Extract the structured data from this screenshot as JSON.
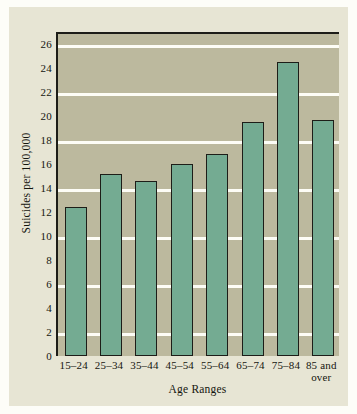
{
  "chart_data": {
    "type": "bar",
    "title": "",
    "xlabel": "Age Ranges",
    "ylabel": "Suicides per 100,000",
    "categories": [
      "15–24",
      "25–34",
      "35–44",
      "45–54",
      "55–64",
      "65–74",
      "75–84",
      "85 and over"
    ],
    "values": [
      12.4,
      15.2,
      14.6,
      16.0,
      16.8,
      19.5,
      24.5,
      19.7
    ],
    "ylim": [
      0,
      27
    ],
    "yticks": [
      0,
      2,
      4,
      6,
      8,
      10,
      12,
      14,
      16,
      18,
      20,
      22,
      24,
      26
    ],
    "ytick_labels": [
      "0",
      "2",
      "4",
      "6",
      "8",
      "10",
      "12",
      "14",
      "16",
      "18",
      "20",
      "22",
      "24",
      "26"
    ],
    "gridlines": [
      2,
      6,
      10,
      14,
      18,
      22,
      26
    ],
    "grid": true,
    "legend": "none",
    "bar_color": "#74ab92",
    "bar_edge_color": "#1d1d18",
    "plot_background": "#bcb99e",
    "figure_background": "#e7e5d4",
    "gridline_color": "#fdfdf6"
  }
}
